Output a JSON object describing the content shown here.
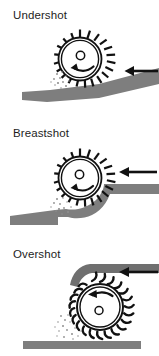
{
  "figure": {
    "kind": "water-wheel-diagram",
    "panel_count": 3,
    "background_color": "#ffffff",
    "stroke_color": "#111111",
    "water_color": "#7e7e7e",
    "spray_color": "#9a9a9a"
  },
  "panels": [
    {
      "id": "undershot",
      "title": "Undershot",
      "wheel": {
        "center_x": 80,
        "center_y": 59,
        "rim_outer_radius": 21.5,
        "rim_inner_radius": 19.0,
        "hub_radius": 4.2,
        "tooth_count": 18,
        "tooth_length": 8.0,
        "tooth_type": "straight-paddle",
        "rotation_label": "counter-clockwise"
      },
      "water": {
        "type": "sloping-channel",
        "flow_direction": "right-to-left",
        "contact": "bottom-of-wheel"
      },
      "arrow": {
        "direction": "left",
        "x_start": 158,
        "x_end": 126,
        "y": 71
      },
      "spray": {
        "x": 58,
        "y": 80
      }
    },
    {
      "id": "breastshot",
      "title": "Breastshot",
      "wheel": {
        "center_x": 80,
        "center_y": 178,
        "rim_outer_radius": 21.5,
        "rim_inner_radius": 19.0,
        "hub_radius": 4.2,
        "tooth_count": 18,
        "tooth_length": 8.0,
        "tooth_type": "straight-paddle",
        "rotation_label": "counter-clockwise"
      },
      "water": {
        "type": "curved-breast-channel",
        "flow_direction": "right-to-left",
        "contact": "mid-height-of-wheel"
      },
      "arrow": {
        "direction": "left",
        "x_start": 157,
        "x_end": 119,
        "y": 172
      },
      "spray": {
        "x": 60,
        "y": 205
      }
    },
    {
      "id": "overshot",
      "title": "Overshot",
      "wheel": {
        "center_x": 92,
        "center_y": 304,
        "rim_outer_radius": 23.0,
        "rim_inner_radius": 20.5,
        "hub_radius": 4.0,
        "tooth_count": 18,
        "tooth_length": 11.0,
        "tooth_type": "hooked-bucket",
        "rotation_label": "counter-clockwise"
      },
      "water": {
        "type": "overhead-flume",
        "flow_direction": "right-to-left",
        "contact": "top-of-wheel"
      },
      "arrow": {
        "direction": "left",
        "x_start": 158,
        "x_end": 119,
        "y": 272
      },
      "spray": {
        "x": 63,
        "y": 330
      },
      "ground": {
        "x": 23,
        "y": 341,
        "width": 118,
        "height": 8
      }
    }
  ]
}
